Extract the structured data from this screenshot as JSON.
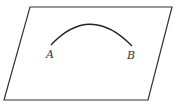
{
  "figure": {
    "shape": "parallelogram-plane",
    "curve": "arc",
    "points": [
      {
        "label": "A"
      },
      {
        "label": "B"
      }
    ],
    "stroke_color": "#333333"
  }
}
